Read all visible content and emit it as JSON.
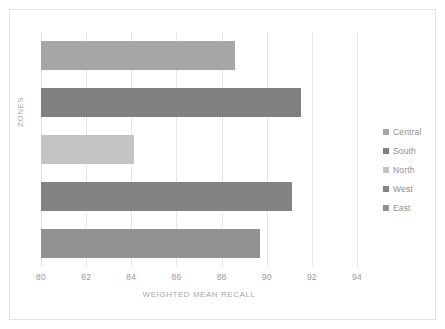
{
  "chart_data": {
    "type": "bar",
    "orientation": "horizontal",
    "title": "",
    "xlabel": "WEIGHTED MEAN RECALL",
    "ylabel": "ZONES",
    "xlim": [
      80,
      94
    ],
    "xticks": [
      80,
      82,
      84,
      86,
      88,
      90,
      92,
      94
    ],
    "xtick_labels": [
      "80",
      "82",
      "84",
      "86",
      "88",
      "90",
      "92",
      "94"
    ],
    "grid": "vertical",
    "legend_position": "right",
    "categories": [
      "Central",
      "South",
      "North",
      "West",
      "East"
    ],
    "values": [
      88.6,
      91.5,
      84.1,
      91.1,
      89.7
    ],
    "series": [
      {
        "name": "Weighted Mean Recall",
        "points": [
          {
            "category": "Central",
            "value": 88.6,
            "color": "#a6a6a6"
          },
          {
            "category": "South",
            "value": 91.5,
            "color": "#808080"
          },
          {
            "category": "North",
            "value": 84.1,
            "color": "#c4c4c4"
          },
          {
            "category": "West",
            "value": 91.1,
            "color": "#838383"
          },
          {
            "category": "East",
            "value": 89.7,
            "color": "#919191"
          }
        ]
      }
    ]
  },
  "legend": {
    "items": [
      {
        "label": "Central",
        "color": "#a6a6a6"
      },
      {
        "label": "South",
        "color": "#808080"
      },
      {
        "label": "North",
        "color": "#c4c4c4"
      },
      {
        "label": "West",
        "color": "#838383"
      },
      {
        "label": "East",
        "color": "#919191"
      }
    ]
  },
  "colors": {
    "frame_border": "#e4e4e4",
    "gridline": "#e8e8e8",
    "tick_label": "#9a9a9a",
    "axis_title": "#a8a8a8",
    "legend_label": "#8f8f8f",
    "background": "#ffffff"
  }
}
